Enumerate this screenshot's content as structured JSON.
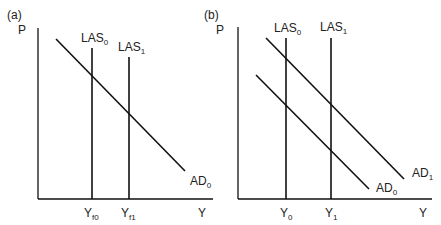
{
  "panels": [
    {
      "id": "a",
      "panel_label": "(a)",
      "y_axis_label": "P",
      "x_axis_label": "Y",
      "vertical_lines": [
        {
          "name": "LAS",
          "sub": "0",
          "tick_main": "Y",
          "tick_sub": "f0"
        },
        {
          "name": "LAS",
          "sub": "1",
          "tick_main": "Y",
          "tick_sub": "f1"
        }
      ],
      "demand_curves": [
        {
          "name": "AD",
          "sub": "0"
        }
      ]
    },
    {
      "id": "b",
      "panel_label": "(b)",
      "y_axis_label": "P",
      "x_axis_label": "Y",
      "vertical_lines": [
        {
          "name": "LAS",
          "sub": "0",
          "tick_main": "Y",
          "tick_sub": "0"
        },
        {
          "name": "LAS",
          "sub": "1",
          "tick_main": "Y",
          "tick_sub": "1"
        }
      ],
      "demand_curves": [
        {
          "name": "AD",
          "sub": "0"
        },
        {
          "name": "AD",
          "sub": "1"
        }
      ]
    }
  ]
}
